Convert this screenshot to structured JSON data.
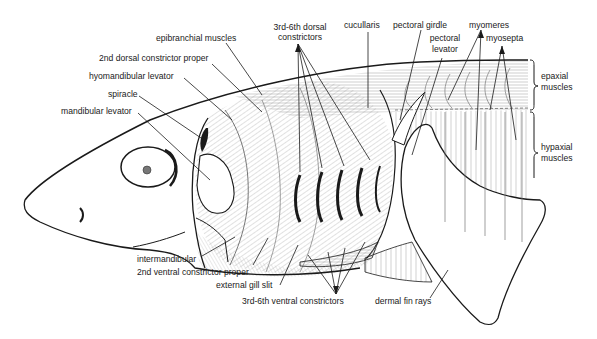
{
  "diagram": {
    "labels": {
      "epibranchial": "epibranchial muscles",
      "dorsal_constrictors_1": "3rd-6th dorsal",
      "dorsal_constrictors_2": "constrictors",
      "cucullaris": "cucullaris",
      "pectoral_girdle": "pectoral girdle",
      "myomeres": "myomeres",
      "pectoral_levator_1": "pectoral",
      "pectoral_levator_2": "levator",
      "myosepta": "myosepta",
      "second_dorsal_constrictor": "2nd dorsal constrictor proper",
      "hyomandibular_levator": "hyomandibular levator",
      "spiracle": "spiracle",
      "mandibular_levator": "mandibular levator",
      "epaxial_1": "epaxial",
      "epaxial_2": "muscles",
      "hypaxial_1": "hypaxial",
      "hypaxial_2": "muscles",
      "intermandibular": "intermandibular",
      "second_ventral_constrictor": "2nd ventral constrictor proper",
      "external_gill_slit": "external gill slit",
      "ventral_constrictors": "3rd-6th ventral constrictors",
      "dermal_fin_rays": "dermal fin rays"
    },
    "colors": {
      "ink": "#1a1a1a",
      "background": "#ffffff",
      "hatch": "#8a8a8a"
    }
  }
}
